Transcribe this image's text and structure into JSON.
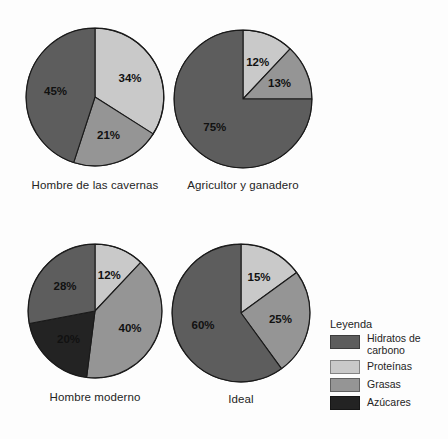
{
  "figure": {
    "background": "#fdfdfd",
    "palette": {
      "hidratos": "#5d5d5d",
      "proteinas": "#c9c9c9",
      "grasas": "#959595",
      "azucares": "#232323",
      "stroke": "#1a1a1a"
    }
  },
  "legend": {
    "title": "Leyenda",
    "items": [
      {
        "label": "Hidratos de carbono",
        "color": "#5d5d5d",
        "key": "hidratos"
      },
      {
        "label": "Proteínas",
        "color": "#c9c9c9",
        "key": "proteinas"
      },
      {
        "label": "Grasas",
        "color": "#959595",
        "key": "grasas"
      },
      {
        "label": "Azúcares",
        "color": "#232323",
        "key": "azucares"
      }
    ]
  },
  "charts": [
    {
      "id": "hombre-de-las-cavernas",
      "caption": "Hombre de las cavernas",
      "labels": [
        "34%",
        "21%",
        "45%"
      ]
    },
    {
      "id": "agricultor-y-ganadero",
      "caption": "Agricultor y ganadero",
      "labels": [
        "12%",
        "13%",
        "75%"
      ]
    },
    {
      "id": "hombre-moderno",
      "caption": "Hombre moderno",
      "labels": [
        "12%",
        "40%",
        "20%",
        "28%"
      ]
    },
    {
      "id": "ideal",
      "caption": "Ideal",
      "labels": [
        "15%",
        "25%",
        "60%"
      ]
    }
  ],
  "chart_data": [
    {
      "type": "pie",
      "title": "Hombre de las cavernas",
      "categories": [
        "Proteínas",
        "Grasas",
        "Hidratos de carbono"
      ],
      "values": [
        34,
        21,
        45
      ],
      "labels": [
        "34%",
        "21%",
        "45%"
      ],
      "colors": [
        "#c9c9c9",
        "#959595",
        "#5d5d5d"
      ],
      "units": "percent",
      "legend": "shared"
    },
    {
      "type": "pie",
      "title": "Agricultor y ganadero",
      "categories": [
        "Proteínas",
        "Grasas",
        "Hidratos de carbono"
      ],
      "values": [
        12,
        13,
        75
      ],
      "labels": [
        "12%",
        "13%",
        "75%"
      ],
      "colors": [
        "#c9c9c9",
        "#959595",
        "#5d5d5d"
      ],
      "units": "percent",
      "legend": "shared"
    },
    {
      "type": "pie",
      "title": "Hombre moderno",
      "categories": [
        "Proteínas",
        "Grasas",
        "Azúcares",
        "Hidratos de carbono"
      ],
      "values": [
        12,
        40,
        20,
        28
      ],
      "labels": [
        "12%",
        "40%",
        "20%",
        "28%"
      ],
      "colors": [
        "#c9c9c9",
        "#959595",
        "#232323",
        "#5d5d5d"
      ],
      "units": "percent",
      "legend": "shared"
    },
    {
      "type": "pie",
      "title": "Ideal",
      "categories": [
        "Proteínas",
        "Grasas",
        "Hidratos de carbono"
      ],
      "values": [
        15,
        25,
        60
      ],
      "labels": [
        "15%",
        "25%",
        "60%"
      ],
      "colors": [
        "#c9c9c9",
        "#959595",
        "#5d5d5d"
      ],
      "units": "percent",
      "legend": "shared"
    }
  ]
}
